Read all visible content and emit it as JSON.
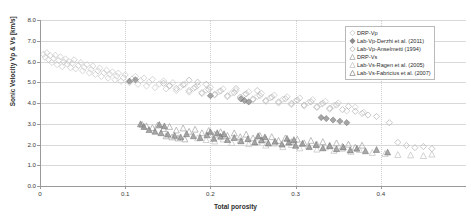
{
  "axes": {
    "y_title": "Sonic Velocity Vp & Vs [km/s]",
    "x_title": "Total porosity",
    "y_ticks": [
      "0.0",
      "1.0",
      "2.0",
      "3.0",
      "4.0",
      "5.0",
      "6.0",
      "7.0",
      "8.0"
    ],
    "x_ticks": [
      "0",
      "0.1",
      "0.2",
      "0.3",
      "0.4"
    ]
  },
  "legend": {
    "items": [
      {
        "label": "DRP-Vp",
        "marker": "diamond-open-light",
        "color": "#c9c9c9"
      },
      {
        "label": "Lab-Vp-Derzhi et al. (2011)",
        "marker": "diamond-filled-dark",
        "color": "#8d8d8d"
      },
      {
        "label": "Lab-Vp-Anselmetti (1994)",
        "marker": "diamond-open-mid",
        "color": "#b4b4b4"
      },
      {
        "label": "DRP-Vs",
        "marker": "triangle-open-mid",
        "color": "#a8a8a8"
      },
      {
        "label": "Lab-Vs-Ragen et al. (2005)",
        "marker": "triangle-open-light",
        "color": "#c4c4c4"
      },
      {
        "label": "Lab-Vs-Fabricius et al. (2007)",
        "marker": "triangle-open-dark",
        "color": "#8f8f8f"
      }
    ]
  },
  "chart_data": {
    "type": "scatter",
    "title": "",
    "xlabel": "Total porosity",
    "ylabel": "Sonic Velocity Vp & Vs [km/s]",
    "xlim": [
      0,
      0.5
    ],
    "ylim": [
      0,
      8
    ],
    "xticks": [
      0,
      0.1,
      0.2,
      0.3,
      0.4
    ],
    "yticks": [
      0,
      1,
      2,
      3,
      4,
      5,
      6,
      7,
      8
    ],
    "grid": true,
    "legend_position": "top-right",
    "series": [
      {
        "name": "DRP-Vp",
        "marker": "diamond",
        "fill": "none",
        "color": "#c9c9c9",
        "points": [
          [
            0.004,
            6.35
          ],
          [
            0.006,
            6.2
          ],
          [
            0.008,
            6.42
          ],
          [
            0.01,
            6.1
          ],
          [
            0.012,
            6.28
          ],
          [
            0.014,
            5.95
          ],
          [
            0.016,
            6.15
          ],
          [
            0.018,
            6.3
          ],
          [
            0.02,
            5.85
          ],
          [
            0.022,
            6.05
          ],
          [
            0.024,
            6.22
          ],
          [
            0.026,
            5.75
          ],
          [
            0.028,
            5.98
          ],
          [
            0.03,
            6.12
          ],
          [
            0.032,
            5.88
          ],
          [
            0.034,
            6.0
          ],
          [
            0.036,
            5.7
          ],
          [
            0.038,
            5.92
          ],
          [
            0.04,
            6.08
          ],
          [
            0.042,
            5.65
          ],
          [
            0.045,
            5.8
          ],
          [
            0.048,
            5.95
          ],
          [
            0.05,
            5.55
          ],
          [
            0.052,
            5.72
          ],
          [
            0.055,
            5.85
          ],
          [
            0.058,
            5.45
          ],
          [
            0.06,
            5.62
          ],
          [
            0.062,
            5.78
          ],
          [
            0.065,
            5.38
          ],
          [
            0.068,
            5.55
          ],
          [
            0.07,
            5.68
          ],
          [
            0.072,
            5.28
          ],
          [
            0.075,
            5.45
          ],
          [
            0.078,
            5.58
          ],
          [
            0.08,
            5.2
          ],
          [
            0.082,
            5.38
          ],
          [
            0.085,
            5.5
          ],
          [
            0.088,
            5.12
          ],
          [
            0.09,
            5.3
          ],
          [
            0.092,
            5.44
          ],
          [
            0.095,
            5.05
          ],
          [
            0.098,
            5.22
          ],
          [
            0.1,
            5.36
          ],
          [
            0.105,
            4.98
          ],
          [
            0.108,
            5.15
          ],
          [
            0.112,
            5.28
          ],
          [
            0.115,
            4.9
          ],
          [
            0.118,
            5.08
          ],
          [
            0.122,
            5.2
          ],
          [
            0.125,
            4.82
          ],
          [
            0.128,
            5.0
          ],
          [
            0.132,
            5.14
          ],
          [
            0.135,
            4.74
          ],
          [
            0.14,
            4.92
          ],
          [
            0.145,
            5.06
          ],
          [
            0.148,
            4.68
          ],
          [
            0.152,
            4.85
          ],
          [
            0.156,
            4.98
          ],
          [
            0.16,
            4.6
          ],
          [
            0.165,
            4.78
          ],
          [
            0.17,
            4.9
          ],
          [
            0.175,
            4.52
          ],
          [
            0.18,
            4.7
          ],
          [
            0.185,
            4.84
          ],
          [
            0.19,
            4.45
          ],
          [
            0.195,
            4.62
          ],
          [
            0.2,
            4.76
          ],
          [
            0.205,
            4.38
          ],
          [
            0.21,
            4.55
          ],
          [
            0.215,
            4.68
          ],
          [
            0.22,
            4.3
          ],
          [
            0.225,
            4.48
          ],
          [
            0.23,
            4.6
          ],
          [
            0.235,
            4.22
          ],
          [
            0.24,
            4.4
          ],
          [
            0.245,
            4.54
          ],
          [
            0.25,
            4.15
          ],
          [
            0.255,
            4.32
          ],
          [
            0.26,
            4.46
          ],
          [
            0.265,
            4.08
          ],
          [
            0.27,
            4.25
          ],
          [
            0.275,
            4.38
          ],
          [
            0.28,
            4.0
          ],
          [
            0.285,
            4.18
          ],
          [
            0.29,
            4.3
          ],
          [
            0.295,
            3.92
          ],
          [
            0.3,
            4.1
          ],
          [
            0.305,
            4.24
          ],
          [
            0.31,
            3.85
          ],
          [
            0.315,
            4.02
          ],
          [
            0.32,
            4.16
          ],
          [
            0.325,
            3.78
          ],
          [
            0.33,
            3.95
          ],
          [
            0.335,
            4.08
          ],
          [
            0.34,
            3.7
          ],
          [
            0.345,
            3.88
          ],
          [
            0.35,
            4.0
          ],
          [
            0.36,
            3.62
          ],
          [
            0.37,
            3.8
          ],
          [
            0.38,
            3.55
          ]
        ]
      },
      {
        "name": "Lab-Vp-Derzhi et al. (2011)",
        "marker": "diamond",
        "fill": "solid",
        "color": "#8d8d8d",
        "points": [
          [
            0.2,
            4.35
          ],
          [
            0.236,
            4.2
          ],
          [
            0.24,
            4.12
          ],
          [
            0.245,
            4.05
          ],
          [
            0.33,
            3.3
          ],
          [
            0.336,
            3.25
          ],
          [
            0.344,
            3.18
          ],
          [
            0.352,
            3.12
          ],
          [
            0.36,
            3.05
          ],
          [
            0.105,
            5.05
          ],
          [
            0.112,
            5.12
          ]
        ]
      },
      {
        "name": "Lab-Vp-Anselmetti (1994)",
        "marker": "diamond",
        "fill": "none",
        "color": "#b4b4b4",
        "points": [
          [
            0.145,
            4.95
          ],
          [
            0.152,
            4.82
          ],
          [
            0.16,
            4.7
          ],
          [
            0.168,
            4.88
          ],
          [
            0.175,
            4.6
          ],
          [
            0.182,
            4.75
          ],
          [
            0.19,
            4.5
          ],
          [
            0.198,
            4.65
          ],
          [
            0.205,
            4.42
          ],
          [
            0.212,
            4.58
          ],
          [
            0.22,
            4.35
          ],
          [
            0.228,
            4.5
          ],
          [
            0.235,
            4.28
          ],
          [
            0.242,
            4.44
          ],
          [
            0.25,
            4.2
          ],
          [
            0.258,
            4.36
          ],
          [
            0.265,
            4.12
          ],
          [
            0.272,
            4.28
          ],
          [
            0.28,
            4.05
          ],
          [
            0.288,
            4.2
          ],
          [
            0.295,
            3.98
          ],
          [
            0.302,
            4.14
          ],
          [
            0.31,
            3.9
          ],
          [
            0.318,
            4.06
          ],
          [
            0.325,
            3.82
          ],
          [
            0.332,
            3.98
          ],
          [
            0.34,
            3.75
          ],
          [
            0.348,
            3.9
          ],
          [
            0.355,
            3.68
          ],
          [
            0.362,
            3.84
          ],
          [
            0.37,
            3.6
          ],
          [
            0.378,
            3.5
          ],
          [
            0.385,
            3.42
          ],
          [
            0.395,
            3.35
          ],
          [
            0.41,
            3.05
          ],
          [
            0.42,
            2.1
          ],
          [
            0.43,
            1.95
          ],
          [
            0.44,
            1.85
          ],
          [
            0.45,
            1.9
          ],
          [
            0.46,
            1.8
          ],
          [
            0.175,
            5.1
          ],
          [
            0.185,
            5.0
          ],
          [
            0.195,
            4.9
          ],
          [
            0.23,
            4.7
          ],
          [
            0.255,
            4.6
          ]
        ]
      },
      {
        "name": "DRP-Vs",
        "marker": "triangle",
        "fill": "none",
        "color": "#a8a8a8",
        "points": [
          [
            0.12,
            2.95
          ],
          [
            0.125,
            2.88
          ],
          [
            0.132,
            2.8
          ],
          [
            0.138,
            2.92
          ],
          [
            0.145,
            2.75
          ],
          [
            0.152,
            2.85
          ],
          [
            0.16,
            2.68
          ],
          [
            0.168,
            2.78
          ],
          [
            0.175,
            2.62
          ],
          [
            0.182,
            2.72
          ],
          [
            0.19,
            2.55
          ],
          [
            0.198,
            2.66
          ],
          [
            0.205,
            2.48
          ],
          [
            0.212,
            2.6
          ],
          [
            0.22,
            2.42
          ],
          [
            0.228,
            2.54
          ],
          [
            0.235,
            2.36
          ],
          [
            0.242,
            2.48
          ],
          [
            0.25,
            2.3
          ],
          [
            0.258,
            2.42
          ],
          [
            0.265,
            2.25
          ],
          [
            0.272,
            2.36
          ],
          [
            0.28,
            2.18
          ],
          [
            0.288,
            2.3
          ],
          [
            0.295,
            2.12
          ],
          [
            0.302,
            2.24
          ],
          [
            0.31,
            2.06
          ],
          [
            0.318,
            2.18
          ],
          [
            0.325,
            2.0
          ],
          [
            0.332,
            2.12
          ],
          [
            0.34,
            1.95
          ],
          [
            0.348,
            2.06
          ],
          [
            0.355,
            1.9
          ],
          [
            0.362,
            2.0
          ],
          [
            0.37,
            1.85
          ],
          [
            0.378,
            1.95
          ],
          [
            0.148,
            2.4
          ],
          [
            0.155,
            2.35
          ],
          [
            0.162,
            2.3
          ],
          [
            0.17,
            2.25
          ]
        ]
      },
      {
        "name": "Lab-Vs-Ragen et al. (2005)",
        "marker": "triangle",
        "fill": "none",
        "color": "#c4c4c4",
        "points": [
          [
            0.185,
            2.3
          ],
          [
            0.195,
            2.22
          ],
          [
            0.205,
            2.15
          ],
          [
            0.215,
            2.25
          ],
          [
            0.225,
            2.08
          ],
          [
            0.235,
            2.18
          ],
          [
            0.245,
            2.02
          ],
          [
            0.255,
            2.12
          ],
          [
            0.265,
            1.95
          ],
          [
            0.275,
            2.05
          ],
          [
            0.285,
            1.88
          ],
          [
            0.295,
            1.98
          ],
          [
            0.305,
            1.82
          ],
          [
            0.315,
            1.92
          ],
          [
            0.325,
            1.76
          ],
          [
            0.335,
            1.86
          ],
          [
            0.345,
            1.7
          ],
          [
            0.355,
            1.8
          ],
          [
            0.365,
            1.65
          ],
          [
            0.375,
            1.74
          ],
          [
            0.39,
            1.6
          ],
          [
            0.405,
            1.55
          ],
          [
            0.42,
            1.5
          ],
          [
            0.435,
            1.48
          ],
          [
            0.45,
            1.45
          ],
          [
            0.46,
            1.52
          ]
        ]
      },
      {
        "name": "Lab-Vs-Fabricius et al. (2007)",
        "marker": "triangle",
        "fill": "solid",
        "color": "#8f8f8f",
        "points": [
          [
            0.118,
            2.98
          ],
          [
            0.122,
            2.85
          ],
          [
            0.128,
            2.7
          ],
          [
            0.135,
            2.62
          ],
          [
            0.142,
            2.55
          ],
          [
            0.15,
            2.48
          ],
          [
            0.158,
            2.42
          ],
          [
            0.165,
            2.35
          ],
          [
            0.172,
            2.5
          ],
          [
            0.18,
            2.4
          ],
          [
            0.188,
            2.32
          ],
          [
            0.196,
            2.45
          ],
          [
            0.204,
            2.28
          ],
          [
            0.212,
            2.38
          ],
          [
            0.22,
            2.22
          ],
          [
            0.228,
            2.32
          ],
          [
            0.236,
            2.16
          ],
          [
            0.244,
            2.26
          ],
          [
            0.252,
            2.1
          ],
          [
            0.26,
            2.2
          ],
          [
            0.268,
            2.05
          ],
          [
            0.276,
            2.14
          ],
          [
            0.284,
            2.0
          ],
          [
            0.292,
            2.1
          ],
          [
            0.3,
            1.94
          ],
          [
            0.308,
            2.04
          ],
          [
            0.316,
            1.88
          ],
          [
            0.324,
            1.98
          ],
          [
            0.332,
            1.82
          ],
          [
            0.34,
            1.92
          ],
          [
            0.348,
            1.78
          ],
          [
            0.356,
            1.86
          ],
          [
            0.364,
            1.72
          ],
          [
            0.372,
            1.8
          ],
          [
            0.382,
            1.68
          ],
          [
            0.395,
            1.74
          ],
          [
            0.408,
            1.62
          ],
          [
            0.14,
            2.95
          ],
          [
            0.146,
            2.88
          ],
          [
            0.2,
            2.6
          ],
          [
            0.208,
            2.55
          ],
          [
            0.216,
            2.5
          ],
          [
            0.256,
            2.4
          ],
          [
            0.264,
            2.35
          ],
          [
            0.29,
            2.28
          ],
          [
            0.298,
            2.22
          ]
        ]
      }
    ]
  }
}
